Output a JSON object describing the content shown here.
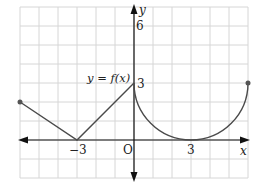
{
  "chart_data": {
    "type": "line",
    "title": "",
    "function_label": "y = f(x)",
    "xlabel": "x",
    "ylabel": "y",
    "origin_label": "O",
    "xlim": [
      -6,
      6
    ],
    "ylim": [
      -2,
      7
    ],
    "grid": true,
    "x_tick_labels": [
      {
        "value": -3,
        "label": "−3"
      },
      {
        "value": 3,
        "label": "3"
      }
    ],
    "y_tick_labels": [
      {
        "value": 3,
        "label": "3"
      },
      {
        "value": 6,
        "label": "6"
      }
    ],
    "series": [
      {
        "name": "f(x) segment 1",
        "kind": "line",
        "points": [
          [
            -6,
            2
          ],
          [
            -3,
            0
          ]
        ]
      },
      {
        "name": "f(x) segment 2",
        "kind": "line",
        "points": [
          [
            -3,
            0
          ],
          [
            0,
            3
          ]
        ]
      },
      {
        "name": "f(x) semicircle",
        "kind": "arc",
        "center": [
          3,
          3
        ],
        "radius": 3,
        "from": [
          0,
          3
        ],
        "to": [
          6,
          3
        ],
        "description": "lower half of circle (x-3)^2 + (y-3)^2 = 9"
      }
    ],
    "endpoints": [
      [
        -6,
        2
      ],
      [
        6,
        3
      ]
    ],
    "colors": {
      "curve": "#4a4a4a",
      "axis": "#111111",
      "grid": "#d6d6d6",
      "endpoint": "#555555"
    }
  },
  "labels": {
    "function": "y = f(x)",
    "x_axis": "x",
    "y_axis": "y",
    "origin": "O",
    "tick_neg3": "−3",
    "tick_3x": "3",
    "tick_3y": "3",
    "tick_6y": "6"
  }
}
